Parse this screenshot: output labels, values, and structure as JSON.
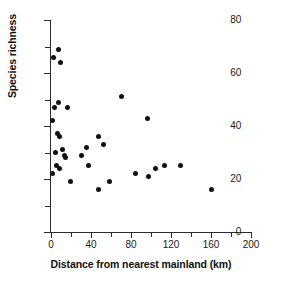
{
  "chart_data": {
    "type": "scatter",
    "title": "",
    "xlabel": "Distance from nearest mainland (km)",
    "ylabel": "Species richness",
    "xlim": [
      0,
      200
    ],
    "ylim": [
      0,
      80
    ],
    "xticks": [
      0,
      40,
      80,
      120,
      160,
      200
    ],
    "xminor_step": 20,
    "yticks": [
      0,
      20,
      40,
      60,
      80
    ],
    "yminor_step": 10,
    "grid": false,
    "legend": null,
    "marker": {
      "shape": "circle",
      "color": "#111111",
      "size": 5
    },
    "points": [
      {
        "x": 1,
        "y": 42
      },
      {
        "x": 1,
        "y": 22
      },
      {
        "x": 2,
        "y": 66
      },
      {
        "x": 3,
        "y": 47
      },
      {
        "x": 4,
        "y": 30
      },
      {
        "x": 5,
        "y": 25
      },
      {
        "x": 6,
        "y": 37
      },
      {
        "x": 7,
        "y": 69
      },
      {
        "x": 7,
        "y": 49
      },
      {
        "x": 8,
        "y": 36
      },
      {
        "x": 8,
        "y": 24
      },
      {
        "x": 9,
        "y": 64
      },
      {
        "x": 11,
        "y": 31
      },
      {
        "x": 13,
        "y": 29
      },
      {
        "x": 14,
        "y": 28
      },
      {
        "x": 16,
        "y": 47
      },
      {
        "x": 19,
        "y": 19
      },
      {
        "x": 30,
        "y": 29
      },
      {
        "x": 35,
        "y": 32
      },
      {
        "x": 37,
        "y": 25
      },
      {
        "x": 47,
        "y": 36
      },
      {
        "x": 47,
        "y": 16
      },
      {
        "x": 52,
        "y": 33
      },
      {
        "x": 58,
        "y": 19
      },
      {
        "x": 70,
        "y": 51
      },
      {
        "x": 84,
        "y": 22
      },
      {
        "x": 96,
        "y": 43
      },
      {
        "x": 97,
        "y": 21
      },
      {
        "x": 104,
        "y": 24
      },
      {
        "x": 113,
        "y": 25
      },
      {
        "x": 129,
        "y": 25
      },
      {
        "x": 160,
        "y": 16
      }
    ]
  }
}
